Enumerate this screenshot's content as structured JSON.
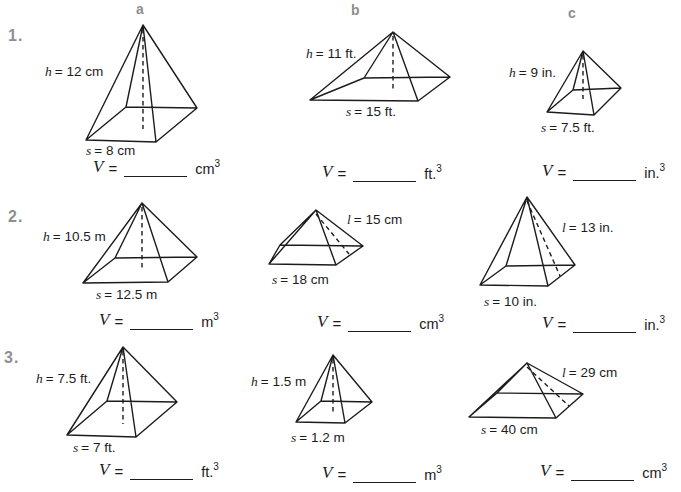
{
  "worksheet": {
    "columns": [
      "a",
      "b",
      "c"
    ],
    "rows": [
      "1.",
      "2.",
      "3."
    ]
  },
  "shared": {
    "v_symbol": "V",
    "equals": "=",
    "exponent": "3"
  },
  "colors": {
    "header_gray": "#8f8f8f",
    "ink": "#1c1c1c",
    "background": "#ffffff"
  },
  "cells": [
    {
      "id": "1a",
      "given_symbol": "h",
      "given_rest": "= 12 cm",
      "side_symbol": "s",
      "side_rest": "= 8 cm",
      "unit": "cm"
    },
    {
      "id": "1b",
      "given_symbol": "h",
      "given_rest": "= 11 ft.",
      "side_symbol": "s",
      "side_rest": "= 15 ft.",
      "unit": "ft."
    },
    {
      "id": "1c",
      "given_symbol": "h",
      "given_rest": "= 9 in.",
      "side_symbol": "s",
      "side_rest": "= 7.5 ft.",
      "unit": "in."
    },
    {
      "id": "2a",
      "given_symbol": "h",
      "given_rest": "= 10.5 m",
      "side_symbol": "s",
      "side_rest": "= 12.5 m",
      "unit": "m"
    },
    {
      "id": "2b",
      "given_symbol": "l",
      "given_rest": "= 15 cm",
      "side_symbol": "s",
      "side_rest": "= 18 cm",
      "unit": "cm"
    },
    {
      "id": "2c",
      "given_symbol": "l",
      "given_rest": "= 13 in.",
      "side_symbol": "s",
      "side_rest": "= 10 in.",
      "unit": "in."
    },
    {
      "id": "3a",
      "given_symbol": "h",
      "given_rest": "= 7.5 ft.",
      "side_symbol": "s",
      "side_rest": "= 7 ft.",
      "unit": "ft."
    },
    {
      "id": "3b",
      "given_symbol": "h",
      "given_rest": "= 1.5 m",
      "side_symbol": "s",
      "side_rest": "= 1.2 m",
      "unit": "m"
    },
    {
      "id": "3c",
      "given_symbol": "l",
      "given_rest": "= 29 cm",
      "side_symbol": "s",
      "side_rest": "= 40 cm",
      "unit": "cm"
    }
  ]
}
